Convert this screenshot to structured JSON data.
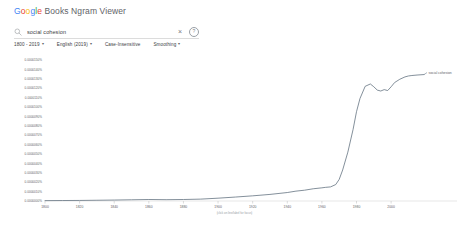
{
  "header": {
    "logo_google": "Google",
    "logo_rest": " Books Ngram Viewer"
  },
  "search": {
    "icon": "search-icon",
    "value": "social cohesion",
    "placeholder": "",
    "clear_icon": "×",
    "help_icon": "?"
  },
  "controls": {
    "date_range": "1800 - 2019",
    "corpus": "English (2019)",
    "case_insensitive": "Case-Insensitive",
    "smoothing": "Smoothing",
    "caret": "▾"
  },
  "chart_data": {
    "type": "line",
    "title": "",
    "xlabel": "",
    "ylabel": "",
    "caption": "(click on line/label for focus)",
    "grid": false,
    "legend_position": "line-end",
    "xlim": [
      1800,
      2019
    ],
    "ylim": [
      0,
      1.5e-05
    ],
    "xticks": [
      1800,
      1820,
      1840,
      1860,
      1880,
      1900,
      1920,
      1940,
      1960,
      1980,
      2000
    ],
    "xtick_labels": [
      "1800",
      "1820",
      "1840",
      "1860",
      "1880",
      "1900",
      "1920",
      "1940",
      "1960",
      "1980",
      "2000"
    ],
    "ytick_labels": [
      "0.0000150%",
      "0.0000140%",
      "0.0000130%",
      "0.0000120%",
      "0.0000110%",
      "0.0000100%",
      "0.0000090%",
      "0.0000080%",
      "0.0000070%",
      "0.0000060%",
      "0.0000050%",
      "0.0000040%",
      "0.0000030%",
      "0.0000020%",
      "0.0000010%",
      "0.0000000%"
    ],
    "series": [
      {
        "name": "social cohesion",
        "color": "#5b6b7a",
        "x": [
          1800,
          1810,
          1820,
          1830,
          1840,
          1850,
          1860,
          1870,
          1880,
          1890,
          1900,
          1910,
          1920,
          1930,
          1940,
          1945,
          1950,
          1955,
          1960,
          1962,
          1965,
          1968,
          1970,
          1972,
          1975,
          1978,
          1980,
          1982,
          1985,
          1988,
          1990,
          1992,
          1994,
          1996,
          1998,
          2000,
          2002,
          2005,
          2008,
          2010,
          2012,
          2015,
          2019
        ],
        "values": [
          4e-08,
          5e-08,
          6e-08,
          8e-08,
          1e-07,
          1.3e-07,
          1.6e-07,
          1.4e-07,
          1.6e-07,
          2e-07,
          3e-07,
          4.2e-07,
          5.5e-07,
          7e-07,
          9e-07,
          1.05e-06,
          1.15e-06,
          1.3e-06,
          1.4e-06,
          1.45e-06,
          1.5e-06,
          1.75e-06,
          2.3e-06,
          3.3e-06,
          5.2e-06,
          7.6e-06,
          9.5e-06,
          1.09e-05,
          1.22e-05,
          1.245e-05,
          1.215e-05,
          1.18e-05,
          1.17e-05,
          1.185e-05,
          1.175e-05,
          1.215e-05,
          1.26e-05,
          1.295e-05,
          1.32e-05,
          1.33e-05,
          1.335e-05,
          1.34e-05,
          1.345e-05
        ]
      }
    ]
  }
}
